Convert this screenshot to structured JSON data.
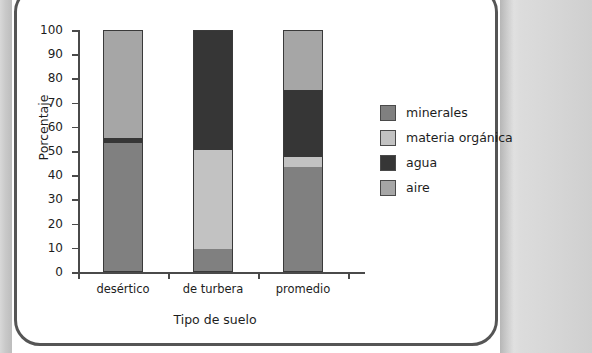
{
  "chart_data": {
    "type": "bar",
    "stacked": true,
    "title": "",
    "xlabel": "Tipo de suelo",
    "ylabel": "Porcentaje",
    "ylim": [
      0,
      100
    ],
    "ytick_step": 10,
    "yticks": [
      0,
      10,
      20,
      30,
      40,
      50,
      60,
      70,
      80,
      90,
      100
    ],
    "grid": false,
    "legend_position": "right",
    "categories": [
      "desértico",
      "de turbera",
      "promedio"
    ],
    "series": [
      {
        "name": "minerales",
        "color": "#808080",
        "values": [
          53,
          9,
          43
        ]
      },
      {
        "name": "materia orgánica",
        "color": "#c2c2c2",
        "values": [
          0,
          41,
          4
        ]
      },
      {
        "name": "agua",
        "color": "#363636",
        "values": [
          2,
          50,
          28
        ]
      },
      {
        "name": "aire",
        "color": "#a6a6a6",
        "values": [
          45,
          0,
          25
        ]
      }
    ],
    "stack_order_bottom_to_top": [
      "minerales",
      "materia orgánica",
      "agua",
      "aire"
    ],
    "bars": [
      {
        "category": "desértico",
        "segments": [
          {
            "name": "minerales",
            "start": 0,
            "end": 53,
            "value": 53,
            "color": "#808080"
          },
          {
            "name": "agua",
            "start": 53,
            "end": 55,
            "value": 2,
            "color": "#363636"
          },
          {
            "name": "aire",
            "start": 55,
            "end": 100,
            "value": 45,
            "color": "#a6a6a6"
          }
        ]
      },
      {
        "category": "de turbera",
        "segments": [
          {
            "name": "minerales",
            "start": 0,
            "end": 9,
            "value": 9,
            "color": "#808080"
          },
          {
            "name": "materia orgánica",
            "start": 9,
            "end": 50,
            "value": 41,
            "color": "#c2c2c2"
          },
          {
            "name": "agua",
            "start": 50,
            "end": 100,
            "value": 50,
            "color": "#363636"
          }
        ]
      },
      {
        "category": "promedio",
        "segments": [
          {
            "name": "minerales",
            "start": 0,
            "end": 43,
            "value": 43,
            "color": "#808080"
          },
          {
            "name": "materia orgánica",
            "start": 43,
            "end": 47,
            "value": 4,
            "color": "#c2c2c2"
          },
          {
            "name": "agua",
            "start": 47,
            "end": 75,
            "value": 28,
            "color": "#363636"
          },
          {
            "name": "aire",
            "start": 75,
            "end": 100,
            "value": 25,
            "color": "#a6a6a6"
          }
        ]
      }
    ],
    "legend": [
      {
        "label": "minerales",
        "color": "#808080"
      },
      {
        "label": "materia orgánica",
        "color": "#c2c2c2"
      },
      {
        "label": "agua",
        "color": "#363636"
      },
      {
        "label": "aire",
        "color": "#a6a6a6"
      }
    ]
  },
  "colors": {
    "axis": "#4a4a4a",
    "text": "#1d1d1d",
    "card_border": "#555555",
    "background": "#ffffff",
    "page_edge": "#d6d6d6"
  }
}
